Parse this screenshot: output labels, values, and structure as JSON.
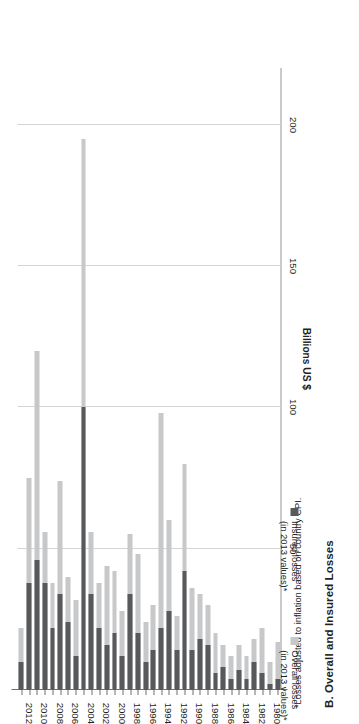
{
  "chart_title": "B. Overall and Insured Losses",
  "footnote": "*Losses adjusted to inflation based on country CPI.",
  "legend": {
    "items": [
      {
        "key": "overall",
        "label_line1": "Overall losses",
        "label_line2": "(in 2013 values)*",
        "color": "#c7c8ca"
      },
      {
        "key": "insured",
        "label_line1": "Insured losses",
        "label_line2": "(in 2013 values)*",
        "color": "#58595b"
      }
    ]
  },
  "chart_data": {
    "type": "bar",
    "orientation": "horizontal",
    "title": "B. Overall and Insured Losses",
    "xlabel": "",
    "ylabel": "Billions US $",
    "value_axis_title": "Billions US $",
    "ylim": [
      0,
      220
    ],
    "value_ticks": [
      200,
      150,
      100,
      50
    ],
    "grid": true,
    "legend_position": "bottom-right",
    "stacked": true,
    "categories": [
      "1980",
      "1981",
      "1982",
      "1983",
      "1984",
      "1985",
      "1986",
      "1987",
      "1988",
      "1989",
      "1990",
      "1991",
      "1992",
      "1993",
      "1994",
      "1995",
      "1996",
      "1997",
      "1998",
      "1999",
      "2000",
      "2001",
      "2002",
      "2003",
      "2004",
      "2005",
      "2006",
      "2007",
      "2008",
      "2009",
      "2010",
      "2011",
      "2012",
      "2013"
    ],
    "year_tick_labels": [
      "1980",
      "1982",
      "1984",
      "1986",
      "1988",
      "1990",
      "1992",
      "1994",
      "1996",
      "1998",
      "2000",
      "2002",
      "2004",
      "2006",
      "2008",
      "2010",
      "2012"
    ],
    "series": [
      {
        "name": "Insured losses (in 2013 values)*",
        "color": "#58595b",
        "values": [
          4,
          2,
          6,
          10,
          4,
          7,
          4,
          8,
          6,
          16,
          18,
          14,
          42,
          14,
          28,
          22,
          14,
          10,
          20,
          34,
          12,
          20,
          16,
          22,
          34,
          100,
          12,
          24,
          34,
          22,
          38,
          46,
          38,
          10
        ]
      },
      {
        "name": "Overall losses (in 2013 values)*",
        "color": "#c7c8ca",
        "values": [
          17,
          10,
          22,
          18,
          12,
          16,
          12,
          16,
          20,
          30,
          34,
          36,
          80,
          26,
          60,
          98,
          30,
          24,
          48,
          55,
          28,
          42,
          44,
          38,
          56,
          195,
          32,
          40,
          74,
          38,
          56,
          120,
          75,
          22
        ]
      }
    ],
    "note": "Overall losses values are total bar length; insured losses is the dark sub-segment measured from the axis."
  }
}
